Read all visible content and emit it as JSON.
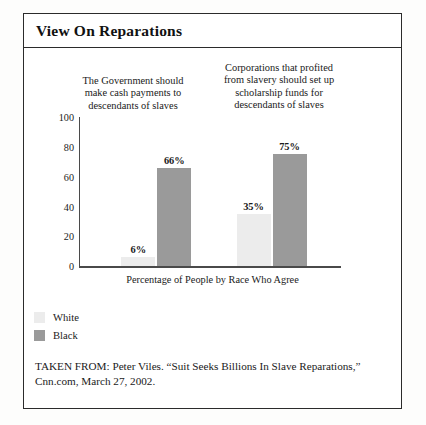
{
  "figure": {
    "title": "View On Reparations",
    "citation_line1": "TAKEN FROM: Peter Viles. “Suit Seeks Billions In Slave Reparations,”",
    "citation_line2": "Cnn.com, March 27, 2002."
  },
  "chart_data": {
    "type": "bar",
    "title": "View On Reparations",
    "subtitle": "",
    "xlabel": "Percentage of People by Race Who Agree",
    "ylabel": "",
    "ylim": [
      0,
      100
    ],
    "yticks": [
      0,
      20,
      40,
      60,
      80,
      100
    ],
    "ytick_labels": [
      "0",
      "20",
      "40",
      "60",
      "80",
      "100"
    ],
    "grid": false,
    "legend_position": "bottom-left",
    "categories": [
      "The Government should make cash payments to descendants of slaves",
      "Corporations that profited from slavery should set up scholarship funds for descendants of slaves"
    ],
    "category_caption_lines": [
      [
        "The Government should",
        "make cash payments to",
        "descendants of slaves"
      ],
      [
        "Corporations that profited",
        "from slavery should set up",
        "scholarship funds for",
        "descendants of slaves"
      ]
    ],
    "series": [
      {
        "name": "White",
        "color": "#ececec",
        "values": [
          6,
          35
        ],
        "labels": [
          "6%",
          "35%"
        ]
      },
      {
        "name": "Black",
        "color": "#9a9a9a",
        "values": [
          66,
          75
        ],
        "labels": [
          "66%",
          "75%"
        ]
      }
    ]
  }
}
